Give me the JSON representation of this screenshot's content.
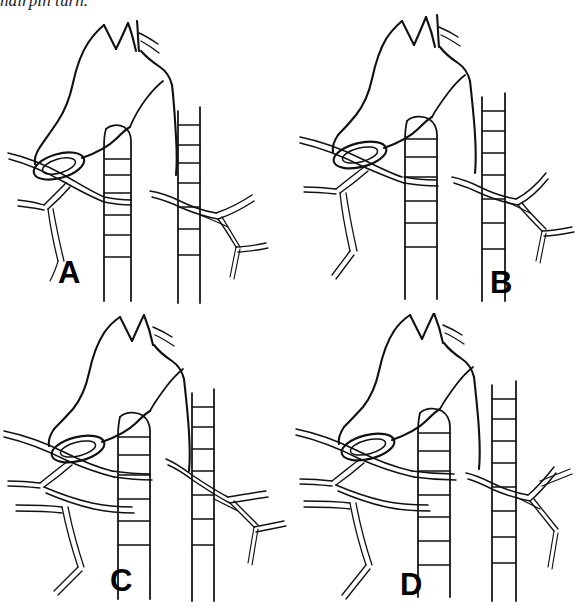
{
  "caption": {
    "text": "hairpin turn.",
    "clipped": true,
    "style": "italic serif, only lower portion of glyphs visible at top edge"
  },
  "figure": {
    "type": "anatomical-line-drawing",
    "layout": "2x2 grid",
    "background_color": "#ffffff",
    "ink_color": "#111111",
    "panels": [
      {
        "id": "a",
        "label": "A",
        "label_x": 58,
        "label_y": 272,
        "description": "aortic arch with left subclavian origin, nerve loops around arch, segmented vessels descending on both sides"
      },
      {
        "id": "b",
        "label": "B",
        "label_x": 196,
        "label_y": 282,
        "description": "aortic arch variant, nerve branch descends lower on left before looping"
      },
      {
        "id": "c",
        "label": "C",
        "label_x": 110,
        "label_y": 278,
        "description": "aortic arch variant with additional lower nerve branch crossing left field"
      },
      {
        "id": "d",
        "label": "D",
        "label_x": 106,
        "label_y": 282,
        "description": "aortic arch variant with broad nerve fan on left and simplified right-side branching"
      }
    ]
  }
}
